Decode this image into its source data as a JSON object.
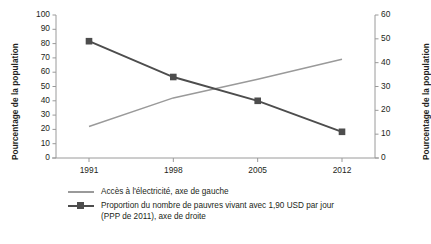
{
  "chart_data": {
    "type": "line",
    "title": "",
    "xlabel": "",
    "categories": [
      "1991",
      "1998",
      "2005",
      "2012"
    ],
    "x": [
      1991,
      1998,
      2005,
      2012
    ],
    "grid": false,
    "legend_position": "bottom-left",
    "axes": {
      "left": {
        "label": "Pourcentage de la population",
        "ylim": [
          0,
          100
        ],
        "ticks": [
          0,
          10,
          20,
          30,
          40,
          50,
          60,
          70,
          80,
          90,
          100
        ],
        "tick_labels": [
          "0",
          "10",
          "20",
          "30",
          "40",
          "50",
          "60",
          "70",
          "80",
          "90",
          "100"
        ]
      },
      "right": {
        "label": "Pourcentage de la population",
        "ylim": [
          0,
          60
        ],
        "ticks": [
          0,
          10,
          20,
          30,
          40,
          50,
          60
        ],
        "tick_labels": [
          "0",
          "10",
          "20",
          "30",
          "40",
          "50",
          "60"
        ]
      }
    },
    "series": [
      {
        "name": "Accès à l'électricité, axe de gauche",
        "axis": "left",
        "color": "#9a9a9a",
        "marker": "none",
        "values": [
          22,
          42,
          55,
          69
        ]
      },
      {
        "name": "Proportion du nombre de pauvres vivant avec 1,90 USD par jour (PPP de 2011), axe de droite",
        "axis": "right",
        "color": "#4d4d4d",
        "marker": "square",
        "values": [
          49,
          34,
          24,
          11
        ]
      }
    ]
  },
  "legend": {
    "entries": [
      {
        "line1": "Accès à l'électricité, axe de gauche",
        "line2": ""
      },
      {
        "line1": "Proportion du nombre de pauvres vivant avec 1,90 USD par jour",
        "line2": "(PPP de 2011), axe de droite"
      }
    ]
  }
}
